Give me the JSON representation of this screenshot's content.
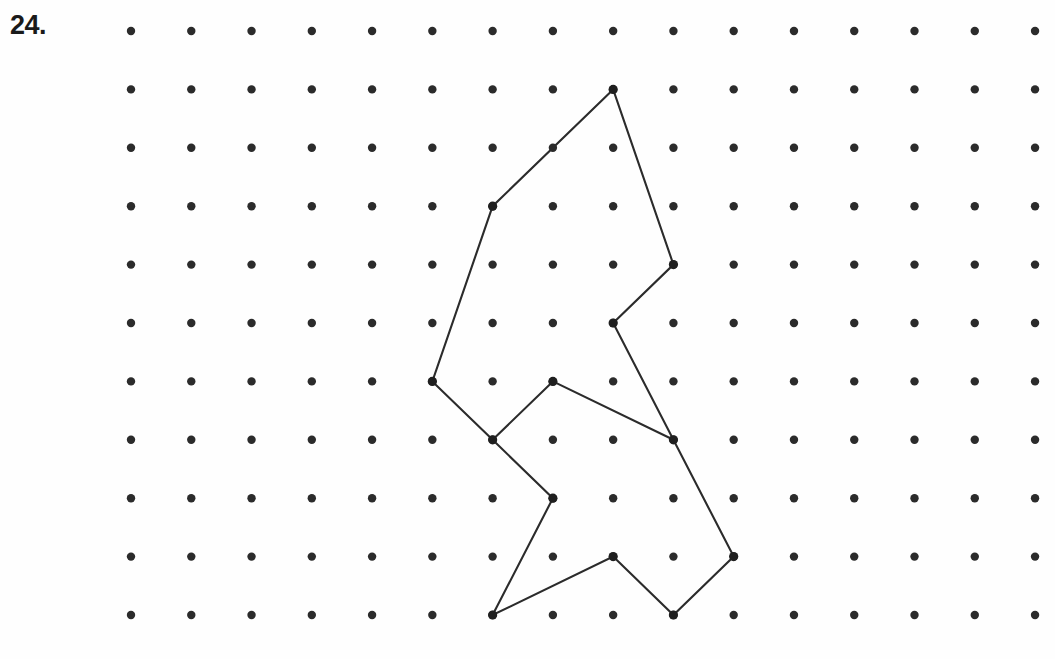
{
  "page": {
    "background_color": "#fefefe",
    "ink_color": "#2b2b2b",
    "width": 1055,
    "height": 659
  },
  "problem": {
    "number_label": "24."
  },
  "grid": {
    "kind": "dot-grid",
    "columns": 16,
    "rows": 11,
    "origin_x": 131,
    "origin_y": 31,
    "spacing_x": 60.27,
    "spacing_y": 58.4,
    "dot_radius": 4.2,
    "dot_color": "#2b2b2b"
  },
  "figure": {
    "name": "geoboard-polygon",
    "stroke_color": "#2b2b2b",
    "stroke_width": 2.1,
    "fill": "none",
    "closed": true,
    "vertices_grid": [
      [
        8,
        1
      ],
      [
        6,
        3
      ],
      [
        5,
        6
      ],
      [
        6,
        7
      ],
      [
        7,
        8
      ],
      [
        6,
        10
      ],
      [
        8,
        9
      ],
      [
        9,
        10
      ],
      [
        10,
        9
      ],
      [
        8,
        5
      ],
      [
        9,
        4
      ]
    ],
    "inner_segment_grid": [
      [
        7,
        6
      ],
      [
        9,
        7
      ]
    ],
    "inner_segment_extra_grid": [
      [
        6,
        7
      ],
      [
        7,
        6
      ]
    ],
    "vertex_count": 11
  },
  "chart_data": {
    "type": "scatter",
    "title": "24.",
    "xlabel": "",
    "ylabel": "",
    "grid": true,
    "legend": "none",
    "x": [
      0,
      1,
      2,
      3,
      4,
      5,
      6,
      7,
      8,
      9,
      10,
      11,
      12,
      13,
      14,
      15
    ],
    "y": [
      0,
      1,
      2,
      3,
      4,
      5,
      6,
      7,
      8,
      9,
      10
    ],
    "xlim": [
      0,
      15
    ],
    "ylim": [
      0,
      10
    ],
    "annotations": [
      "dot grid 16 columns by 11 rows",
      "closed polygon drawn on lattice points",
      "polygon vertices: (8,1) (6,3) (5,6) (6,7) (7,8) (6,10) (8,9) (9,10) (10,9) (8,5) (9,4)"
    ]
  }
}
